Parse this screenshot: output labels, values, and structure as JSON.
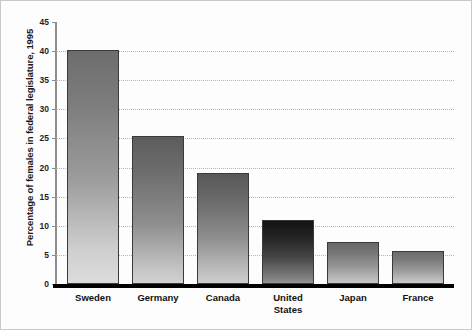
{
  "chart_data": {
    "type": "bar",
    "title": "",
    "xlabel": "",
    "ylabel": "Percentage of females in federal legislature, 1995",
    "categories": [
      "Sweden",
      "Germany",
      "Canada",
      "United States",
      "Japan",
      "France"
    ],
    "values": [
      40.2,
      25.5,
      19.1,
      11.0,
      7.2,
      5.6
    ],
    "ylim": [
      0,
      45
    ],
    "yticks": [
      "0",
      "5",
      "10",
      "15",
      "20",
      "25",
      "30",
      "35",
      "40",
      "45"
    ],
    "ytick_values": [
      0,
      5,
      10,
      15,
      20,
      25,
      30,
      35,
      40,
      45
    ],
    "grid": "horizontal-dotted",
    "legend": "none",
    "bar_style": "vertical-gradient-dark-top-to-light-bottom",
    "bar_colors": [
      {
        "name": "Sweden",
        "top": "#6d6d6d",
        "bottom": "#d8d8d8"
      },
      {
        "name": "Germany",
        "top": "#5e5e5e",
        "bottom": "#c9c9c9"
      },
      {
        "name": "Canada",
        "top": "#5a5a5a",
        "bottom": "#c4c4c4"
      },
      {
        "name": "United States",
        "top": "#151515",
        "bottom": "#8e8e8e"
      },
      {
        "name": "Japan",
        "top": "#6a6a6a",
        "bottom": "#c0c0c0"
      },
      {
        "name": "France",
        "top": "#6f6f6f",
        "bottom": "#c2c2c2"
      }
    ],
    "axis_color": "#8d8d8d",
    "baseline_color": "#000000",
    "background_color": "#ffffff"
  },
  "labels": {
    "cat_0": "Sweden",
    "cat_1": "Germany",
    "cat_2": "Canada",
    "cat_3_line1": "United",
    "cat_3_line2": "States",
    "cat_4": "Japan",
    "cat_5": "France"
  },
  "yticks": {
    "t0": "0",
    "t1": "5",
    "t2": "10",
    "t3": "15",
    "t4": "20",
    "t5": "25",
    "t6": "30",
    "t7": "35",
    "t8": "40",
    "t9": "45"
  }
}
